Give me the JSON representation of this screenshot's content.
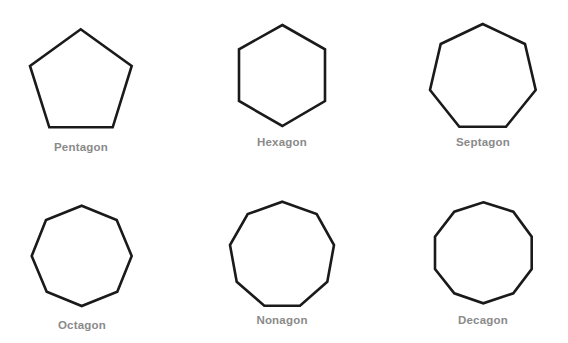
{
  "shapes": [
    {
      "name": "Pentagon",
      "sides": 5,
      "points": "80.7,29.3 131.7,66 112.7,127.3 49.3,127.3 30,66",
      "label_x": 81,
      "label_y": 141
    },
    {
      "name": "Hexagon",
      "sides": 6,
      "points": "282.3,25 325,49.3 325,101 282.3,126 239,101 239,49.3",
      "label_x": 282,
      "label_y": 136
    },
    {
      "name": "Septagon",
      "sides": 7,
      "points": "482.7,24 525,44 535.7,90 506,126.7 459.3,126.7 430,90 440.7,44",
      "label_x": 483,
      "label_y": 136
    },
    {
      "name": "Octagon",
      "sides": 8,
      "points": "81.7,205.7 116.7,220 131.7,256 117.3,291.7 81.7,306 46.7,291.7 31.7,256 46,220",
      "label_x": 82,
      "label_y": 319
    },
    {
      "name": "Nonagon",
      "sides": 9,
      "points": "282.3,201.7 316.7,214 334,245 327.3,281.7 300,305.7 264.3,305.7 236.7,281.7 230,245 247.7,214",
      "label_x": 282,
      "label_y": 314
    },
    {
      "name": "Decagon",
      "sides": 10,
      "points": "483.3,202.3 513.3,211.7 531.7,236.7 531.7,269 513.3,293.3 483.3,303.3 454.3,293.3 435,269 435,236.7 454.3,211.7",
      "label_x": 483,
      "label_y": 314
    }
  ],
  "colors": {
    "stroke": "#1a1a1a",
    "label": "#8a8a8a",
    "background": "#ffffff"
  }
}
